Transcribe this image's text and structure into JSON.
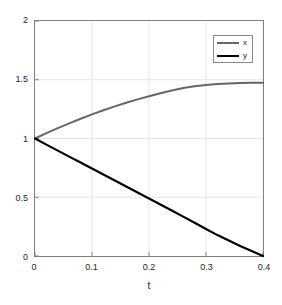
{
  "chart_data": {
    "type": "line",
    "title": "",
    "xlabel": "t",
    "ylabel": "",
    "xlim": [
      0,
      0.4
    ],
    "ylim": [
      0,
      2
    ],
    "grid": true,
    "legend_position": "upper-right",
    "xticks": [
      0,
      0.1,
      0.2,
      0.3,
      0.4
    ],
    "xtick_labels": [
      "0",
      "0.1",
      "0.2",
      "0.3",
      "0.4"
    ],
    "yticks": [
      0,
      0.5,
      1,
      1.5,
      2
    ],
    "ytick_labels": [
      "0",
      "0.5",
      "1",
      "1.5",
      "2"
    ],
    "series": [
      {
        "name": "x",
        "color": "#666666",
        "linewidth": 2,
        "x": [
          0,
          0.02,
          0.04,
          0.06,
          0.08,
          0.1,
          0.12,
          0.14,
          0.16,
          0.18,
          0.2,
          0.22,
          0.24,
          0.26,
          0.28,
          0.3,
          0.32,
          0.34,
          0.36,
          0.38,
          0.4
        ],
        "values": [
          1.0,
          1.045,
          1.088,
          1.129,
          1.168,
          1.205,
          1.24,
          1.273,
          1.304,
          1.333,
          1.36,
          1.385,
          1.408,
          1.429,
          1.445,
          1.456,
          1.464,
          1.469,
          1.472,
          1.474,
          1.475
        ]
      },
      {
        "name": "y",
        "color": "#000000",
        "linewidth": 2.2,
        "x": [
          0,
          0.02,
          0.04,
          0.06,
          0.08,
          0.1,
          0.12,
          0.14,
          0.16,
          0.18,
          0.2,
          0.22,
          0.24,
          0.26,
          0.28,
          0.3,
          0.32,
          0.34,
          0.36,
          0.38,
          0.4
        ],
        "values": [
          1.0,
          0.948,
          0.897,
          0.846,
          0.795,
          0.744,
          0.693,
          0.642,
          0.591,
          0.54,
          0.489,
          0.438,
          0.387,
          0.335,
          0.283,
          0.23,
          0.178,
          0.132,
          0.086,
          0.042,
          0.0
        ]
      }
    ],
    "colors": {
      "axes": "#7f7f7f",
      "grid": "#e6e6e6",
      "text": "#262626",
      "background": "#ffffff"
    }
  },
  "legend": {
    "entries": [
      {
        "label": "x"
      },
      {
        "label": "y"
      }
    ]
  }
}
